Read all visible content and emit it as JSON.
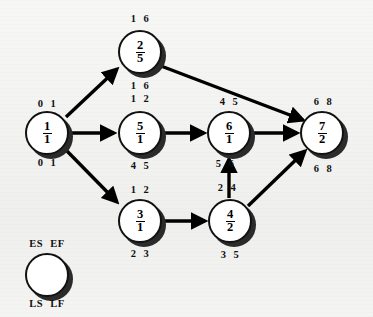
{
  "diagram": {
    "background_color": "#f2f2f0",
    "node_fill": "#ffffff",
    "node_stroke": "#111111",
    "shadow_color": "#2b2b2b",
    "edge_color": "#000000"
  },
  "nodes": [
    {
      "id": "1",
      "activity": "1",
      "duration": "1",
      "es": "0",
      "ef": "1",
      "ls": "0",
      "lf": "1",
      "cx": 47,
      "cy": 133
    },
    {
      "id": "2",
      "activity": "2",
      "duration": "5",
      "es": "1",
      "ef": "6",
      "ls": "1",
      "lf": "6",
      "cx": 140,
      "cy": 52
    },
    {
      "id": "5",
      "activity": "5",
      "duration": "1",
      "es": "1",
      "ef": "2",
      "ls": "4",
      "lf": "5",
      "cx": 140,
      "cy": 133
    },
    {
      "id": "6",
      "activity": "6",
      "duration": "1",
      "es": "4",
      "ef": "5",
      "ls": "5",
      "lf": "6",
      "cx": 229,
      "cy": 133
    },
    {
      "id": "7",
      "activity": "7",
      "duration": "2",
      "es": "6",
      "ef": "8",
      "ls": "6",
      "lf": "8",
      "cx": 322,
      "cy": 133
    },
    {
      "id": "3",
      "activity": "3",
      "duration": "1",
      "es": "1",
      "ef": "2",
      "ls": "2",
      "lf": "3",
      "cx": 140,
      "cy": 221
    },
    {
      "id": "4",
      "activity": "4",
      "duration": "2",
      "es": "2",
      "ef": "4",
      "ls": "3",
      "lf": "5",
      "cx": 230,
      "cy": 221
    }
  ],
  "legend": {
    "es_label": "ES",
    "ef_label": "EF",
    "ls_label": "LS",
    "lf_label": "LF",
    "cx": 47,
    "cy": 275
  },
  "edges": [
    {
      "from": "1",
      "to": "2"
    },
    {
      "from": "1",
      "to": "5"
    },
    {
      "from": "1",
      "to": "3"
    },
    {
      "from": "2",
      "to": "7"
    },
    {
      "from": "5",
      "to": "6"
    },
    {
      "from": "6",
      "to": "7"
    },
    {
      "from": "3",
      "to": "4"
    },
    {
      "from": "4",
      "to": "6"
    },
    {
      "from": "4",
      "to": "7"
    }
  ]
}
